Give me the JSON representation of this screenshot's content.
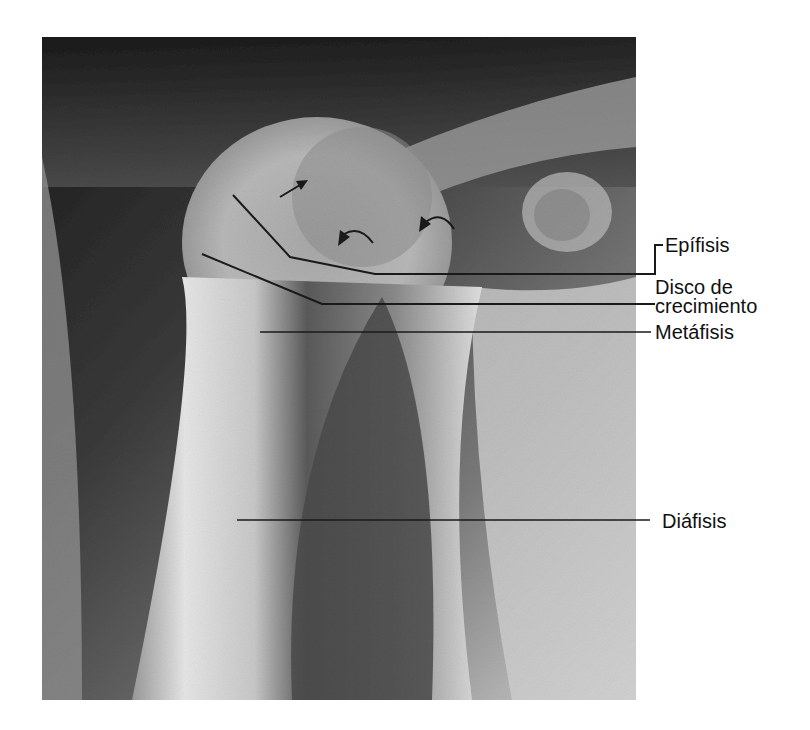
{
  "figure": {
    "type": "radiograph",
    "labels": [
      {
        "id": "epifisis",
        "text": "Epífisis"
      },
      {
        "id": "disco",
        "line1": "Disco de",
        "line2": "crecimiento"
      },
      {
        "id": "metafisis",
        "text": "Metáfisis"
      },
      {
        "id": "diafisis",
        "text": "Diáfisis"
      }
    ],
    "colors": {
      "background": "#ffffff",
      "line": "#1a1a1a",
      "text": "#111111"
    }
  }
}
